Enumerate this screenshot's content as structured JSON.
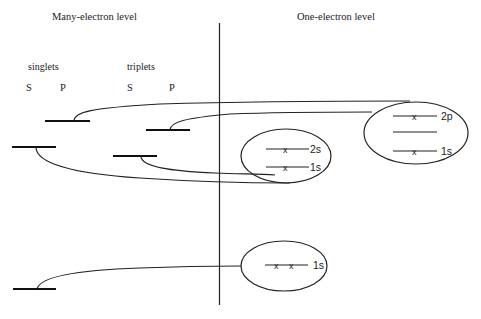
{
  "titles": {
    "left": "Many-electron level",
    "right": "One-electron level"
  },
  "groups": {
    "singlets": "singlets",
    "triplets": "triplets"
  },
  "columns": {
    "singlet_s": "S",
    "singlet_p": "P",
    "triplet_s": "S",
    "triplet_p": "P"
  },
  "many_electron_levels": [
    {
      "id": "singlet-p",
      "group": "singlets",
      "column": "P"
    },
    {
      "id": "triplet-p",
      "group": "triplets",
      "column": "P"
    },
    {
      "id": "singlet-s",
      "group": "singlets",
      "column": "S"
    },
    {
      "id": "triplet-s",
      "group": "triplets",
      "column": "S"
    },
    {
      "id": "ground-s",
      "group": "singlets",
      "column": "S"
    }
  ],
  "configurations": {
    "excited_p": {
      "orbitals": [
        {
          "label": "2p",
          "electrons": 1
        },
        {
          "label": "",
          "electrons": 0
        },
        {
          "label": "1s",
          "electrons": 1
        }
      ]
    },
    "excited_s": {
      "orbitals": [
        {
          "label": "2s",
          "electrons": 1
        },
        {
          "label": "1s",
          "electrons": 1
        }
      ]
    },
    "ground": {
      "orbitals": [
        {
          "label": "1s",
          "electrons": 2
        }
      ]
    }
  },
  "electron_marker": "x"
}
